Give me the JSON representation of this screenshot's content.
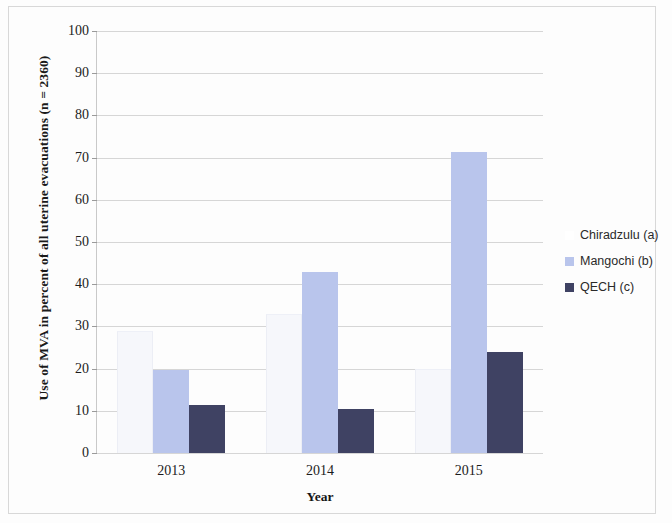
{
  "chart_data": {
    "type": "bar",
    "title": "",
    "xlabel": "Year",
    "ylabel": "Use of MVA in percent of all uterine evacuations (n = 2360)",
    "categories": [
      "2013",
      "2014",
      "2015"
    ],
    "series": [
      {
        "name": "Chiradzulu (a)",
        "color": "#ffffff",
        "values": [
          29.0,
          33.0,
          20.0
        ]
      },
      {
        "name": "Mangochi (b)",
        "color": "#b9c5ec",
        "values": [
          19.7,
          42.9,
          71.3
        ]
      },
      {
        "name": "QECH (c)",
        "color": "#3f4263",
        "values": [
          11.4,
          10.4,
          23.9
        ]
      }
    ],
    "ylim": [
      0,
      100
    ],
    "ytick_values": [
      0,
      10,
      20,
      30,
      40,
      50,
      60,
      70,
      80,
      90,
      100
    ],
    "ytick_labels": [
      "0",
      "10",
      "20",
      "30",
      "40",
      "50",
      "60",
      "70",
      "80",
      "90",
      "100"
    ],
    "grid": true,
    "legend_position": "right"
  },
  "axis": {
    "y_title": "Use of MVA in percent of all uterine evacuations (n = 2360)",
    "x_title": "Year"
  },
  "legend": {
    "entries": [
      {
        "label": "Chiradzulu (a)",
        "swatch": "sw-chiradzulu"
      },
      {
        "label": "Mangochi (b)",
        "swatch": "sw-mangochi"
      },
      {
        "label": "QECH (c)",
        "swatch": "sw-qech"
      }
    ]
  }
}
